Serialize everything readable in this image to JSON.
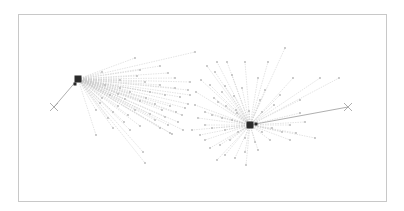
{
  "diagram": {
    "type": "network-graph",
    "frame": {
      "x": 18,
      "y": 14,
      "width": 368,
      "height": 187,
      "stroke": "#c8c8c8"
    },
    "colors": {
      "hub": "#2b2b2b",
      "edge": "#c9c9c9",
      "edge_strong": "#9a9a9a",
      "leaf": "#b5b5b5",
      "x_marker": "#9a9a9a"
    },
    "hubs": [
      {
        "id": "hub-left",
        "x": 78,
        "y": 79,
        "size": 7,
        "marker": {
          "x": 75,
          "y": 84
        },
        "target": {
          "x": 54,
          "y": 107
        }
      },
      {
        "id": "hub-right",
        "x": 250,
        "y": 125,
        "size": 7,
        "marker": {
          "x": 256,
          "y": 124
        },
        "target": {
          "x": 348,
          "y": 107
        }
      }
    ],
    "leaves_left": [
      [
        135,
        58
      ],
      [
        195,
        52
      ],
      [
        102,
        72
      ],
      [
        137,
        76
      ],
      [
        168,
        73
      ],
      [
        190,
        82
      ],
      [
        145,
        82
      ],
      [
        160,
        85
      ],
      [
        175,
        88
      ],
      [
        188,
        90
      ],
      [
        120,
        88
      ],
      [
        130,
        92
      ],
      [
        150,
        92
      ],
      [
        165,
        95
      ],
      [
        180,
        97
      ],
      [
        110,
        95
      ],
      [
        125,
        99
      ],
      [
        140,
        101
      ],
      [
        155,
        104
      ],
      [
        170,
        106
      ],
      [
        185,
        108
      ],
      [
        100,
        103
      ],
      [
        118,
        106
      ],
      [
        135,
        110
      ],
      [
        150,
        114
      ],
      [
        165,
        117
      ],
      [
        178,
        122
      ],
      [
        96,
        110
      ],
      [
        108,
        118
      ],
      [
        124,
        122
      ],
      [
        140,
        126
      ],
      [
        160,
        128
      ],
      [
        172,
        134
      ],
      [
        96,
        135
      ],
      [
        113,
        128
      ],
      [
        130,
        130
      ],
      [
        145,
        163
      ],
      [
        143,
        152
      ],
      [
        170,
        133
      ],
      [
        188,
        104
      ],
      [
        182,
        115
      ],
      [
        120,
        80
      ],
      [
        105,
        85
      ],
      [
        140,
        70
      ],
      [
        160,
        66
      ],
      [
        175,
        78
      ],
      [
        190,
        95
      ],
      [
        113,
        112
      ],
      [
        128,
        115
      ],
      [
        155,
        120
      ],
      [
        168,
        125
      ],
      [
        183,
        130
      ],
      [
        102,
        98
      ],
      [
        118,
        94
      ],
      [
        146,
        98
      ],
      [
        162,
        110
      ],
      [
        176,
        112
      ]
    ],
    "leaves_right": [
      [
        285,
        48
      ],
      [
        268,
        62
      ],
      [
        217,
        62
      ],
      [
        227,
        62
      ],
      [
        245,
        62
      ],
      [
        207,
        66
      ],
      [
        215,
        72
      ],
      [
        232,
        75
      ],
      [
        258,
        78
      ],
      [
        293,
        78
      ],
      [
        320,
        78
      ],
      [
        339,
        78
      ],
      [
        201,
        80
      ],
      [
        210,
        85
      ],
      [
        225,
        86
      ],
      [
        242,
        88
      ],
      [
        265,
        90
      ],
      [
        280,
        95
      ],
      [
        300,
        100
      ],
      [
        214,
        98
      ],
      [
        218,
        102
      ],
      [
        226,
        106
      ],
      [
        236,
        110
      ],
      [
        205,
        112
      ],
      [
        212,
        115
      ],
      [
        222,
        118
      ],
      [
        232,
        120
      ],
      [
        195,
        105
      ],
      [
        198,
        118
      ],
      [
        205,
        125
      ],
      [
        212,
        128
      ],
      [
        225,
        130
      ],
      [
        238,
        132
      ],
      [
        262,
        132
      ],
      [
        272,
        128
      ],
      [
        290,
        125
      ],
      [
        305,
        122
      ],
      [
        315,
        138
      ],
      [
        290,
        140
      ],
      [
        270,
        140
      ],
      [
        255,
        142
      ],
      [
        245,
        138
      ],
      [
        230,
        140
      ],
      [
        220,
        145
      ],
      [
        210,
        148
      ],
      [
        200,
        135
      ],
      [
        192,
        130
      ],
      [
        217,
        160
      ],
      [
        235,
        158
      ],
      [
        245,
        152
      ],
      [
        225,
        155
      ],
      [
        246,
        165
      ],
      [
        258,
        150
      ],
      [
        237,
        113
      ],
      [
        249,
        111
      ],
      [
        262,
        112
      ],
      [
        274,
        105
      ],
      [
        300,
        113
      ],
      [
        222,
        92
      ],
      [
        234,
        96
      ],
      [
        196,
        92
      ],
      [
        260,
        100
      ],
      [
        205,
        140
      ],
      [
        282,
        132
      ],
      [
        296,
        133
      ]
    ]
  }
}
